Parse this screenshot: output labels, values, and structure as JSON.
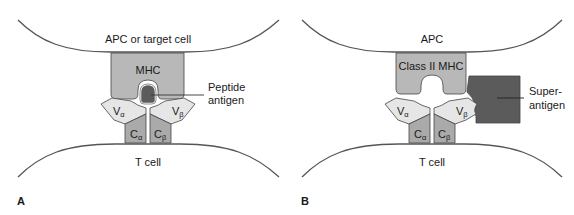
{
  "colors": {
    "membrane": "#555555",
    "mhc": "#b8b8b8",
    "variable_domain": "#e6e6e6",
    "constant_domain": "#aaaaaa",
    "antigen": "#5b5b5b",
    "outline": "#444444"
  },
  "panels": [
    {
      "id": "A",
      "panel_label": "A",
      "top_cell_label": "APC or target cell",
      "mhc_label": "MHC",
      "v_alpha": {
        "base": "V",
        "sub": "α"
      },
      "v_beta": {
        "base": "V",
        "sub": "β"
      },
      "c_alpha": {
        "base": "C",
        "sub": "α"
      },
      "c_beta": {
        "base": "C",
        "sub": "β"
      },
      "antigen_label_line1": "Peptide",
      "antigen_label_line2": "antigen",
      "bottom_cell_label": "T cell"
    },
    {
      "id": "B",
      "panel_label": "B",
      "top_cell_label": "APC",
      "mhc_label": "Class II MHC",
      "v_alpha": {
        "base": "V",
        "sub": "α"
      },
      "v_beta": {
        "base": "V",
        "sub": "β"
      },
      "c_alpha": {
        "base": "C",
        "sub": "α"
      },
      "c_beta": {
        "base": "C",
        "sub": "β"
      },
      "antigen_label_line1": "Super-",
      "antigen_label_line2": "antigen",
      "bottom_cell_label": "T cell"
    }
  ]
}
